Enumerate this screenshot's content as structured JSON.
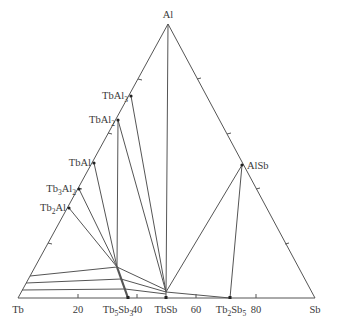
{
  "caption": "",
  "diagram": {
    "type": "ternary-phase-diagram",
    "vertices": {
      "top": {
        "label": "Al",
        "x": 168,
        "y": 24
      },
      "left": {
        "label": "Tb",
        "x": 18,
        "y": 298
      },
      "right": {
        "label": "Sb",
        "x": 315,
        "y": 298
      }
    },
    "axis_ticks": [
      {
        "label": "20",
        "x": 78
      },
      {
        "label": "40",
        "x": 137
      },
      {
        "label": "60",
        "x": 196
      },
      {
        "label": "80",
        "x": 256
      }
    ],
    "phases": [
      {
        "label": "TbAl3",
        "main": "TbAl",
        "sub": "3",
        "x": 131,
        "y": 96
      },
      {
        "label": "TbAl2",
        "main": "TbAl",
        "sub": "2",
        "x": 118,
        "y": 120
      },
      {
        "label": "TbAl",
        "main": "TbAl",
        "sub": "",
        "x": 94,
        "y": 163
      },
      {
        "label": "Tb3Al2",
        "main": "Tb",
        "mid": "3",
        "main2": "Al",
        "sub": "2",
        "x": 79,
        "y": 189
      },
      {
        "label": "Tb2Al",
        "main": "Tb",
        "mid": "2",
        "main2": "Al",
        "sub": "",
        "x": 69,
        "y": 208
      },
      {
        "label": "AlSb",
        "main": "AlSb",
        "sub": "",
        "x": 242,
        "y": 165
      },
      {
        "label": "Tb5Sb3",
        "main": "Tb",
        "mid": "5",
        "main2": "Sb",
        "sub": "3",
        "x": 128,
        "y": 298
      },
      {
        "label": "TbSb",
        "main": "TbSb",
        "sub": "",
        "x": 166,
        "y": 298
      },
      {
        "label": "Tb2Sb5",
        "main": "Tb",
        "mid": "2",
        "main2": "Sb",
        "sub": "5",
        "x": 230,
        "y": 298
      }
    ],
    "colors": {
      "lines": "#555555",
      "text": "#3a3a3a",
      "background": "#ffffff"
    }
  }
}
